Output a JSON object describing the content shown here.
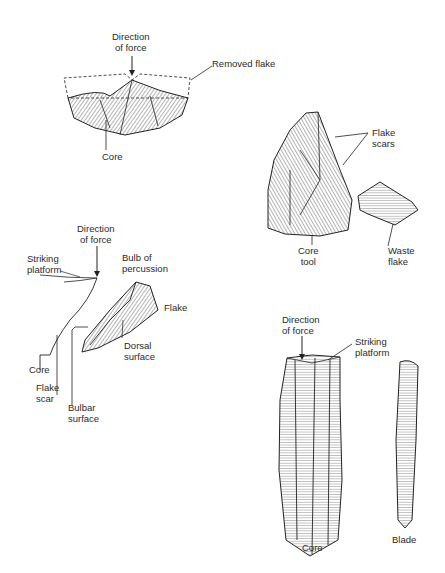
{
  "figures": {
    "flake_removal": {
      "direction_of_force": [
        "Direction",
        "of force"
      ],
      "removed_flake": "Removed flake",
      "core": "Core"
    },
    "core_tool": {
      "flake_scars": [
        "Flake",
        "scars"
      ],
      "core_tool": [
        "Core",
        "tool"
      ],
      "waste_flake": [
        "Waste",
        "flake"
      ]
    },
    "flake_anatomy": {
      "direction_of_force": [
        "Direction",
        "of force"
      ],
      "striking_platform": [
        "Striking",
        "platform"
      ],
      "bulb_of_percussion": [
        "Bulb of",
        "percussion"
      ],
      "flake": "Flake",
      "dorsal_surface": [
        "Dorsal",
        "surface"
      ],
      "core": "Core",
      "flake_scar": [
        "Flake",
        "scar"
      ],
      "bulbar_surface": [
        "Bulbar",
        "surface"
      ]
    },
    "blade_core": {
      "direction_of_force": [
        "Direction",
        "of force"
      ],
      "striking_platform": [
        "Striking",
        "platform"
      ],
      "core": "Core",
      "blade": "Blade"
    }
  }
}
